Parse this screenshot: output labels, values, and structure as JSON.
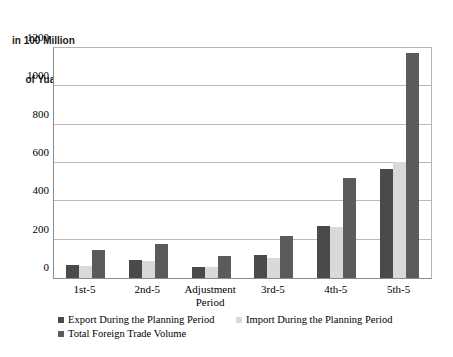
{
  "chart_data": {
    "type": "bar",
    "title": "",
    "axis_title_line1": "in 100 Million",
    "axis_title_line2": "of Yuan",
    "xlabel": "",
    "ylabel": "in 100 Million of Yuan",
    "ylim": [
      0,
      1200
    ],
    "yticks": [
      0,
      200,
      400,
      600,
      800,
      1000,
      1200
    ],
    "ytick_labels": [
      "0",
      "200",
      "400",
      "600",
      "800",
      "1000",
      "1200"
    ],
    "grid": true,
    "legend_position": "bottom-left",
    "categories": [
      "1st-5",
      "2nd-5",
      "Adjustment\nPeriod",
      "3rd-5",
      "4th-5",
      "5th-5"
    ],
    "series": [
      {
        "name": "Export During the Planning Period",
        "color": "#4a4a4a",
        "values": [
          70,
          92,
          58,
          120,
          272,
          570
        ]
      },
      {
        "name": "Import During the Planning Period",
        "color": "#d9d9d9",
        "values": [
          62,
          88,
          55,
          105,
          265,
          605
        ]
      },
      {
        "name": "Total Foreign Trade Volume",
        "color": "#5b5b5b",
        "values": [
          145,
          180,
          113,
          220,
          520,
          1175
        ]
      }
    ]
  },
  "legend": {
    "entries": [
      {
        "label": "Export During the Planning Period",
        "color": "#4a4a4a"
      },
      {
        "label": "Import During the Planning Period",
        "color": "#d9d9d9"
      },
      {
        "label": "Total Foreign Trade Volume",
        "color": "#5b5b5b"
      }
    ]
  }
}
